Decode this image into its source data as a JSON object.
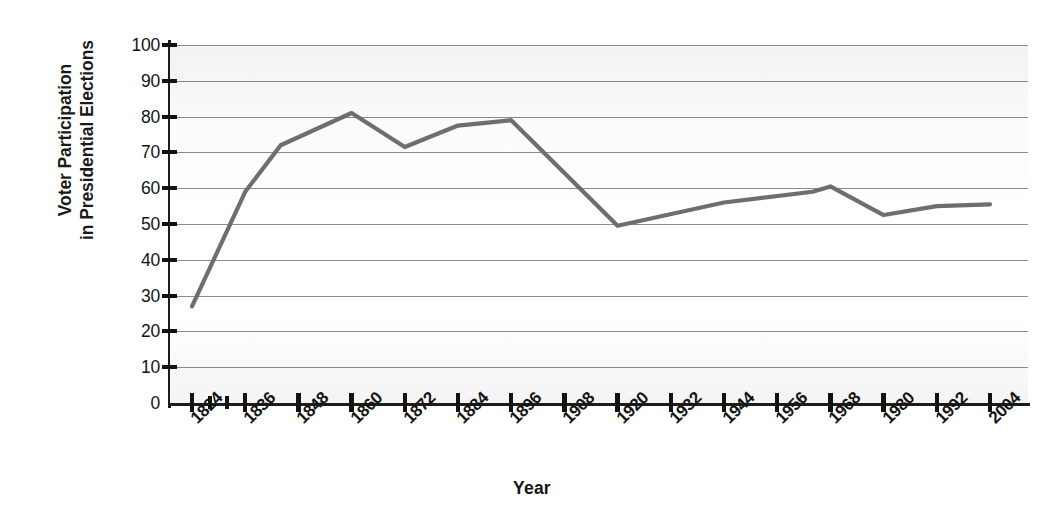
{
  "chart_data": {
    "type": "line",
    "title": "",
    "xlabel": "Year",
    "ylabel": "Voter Participation in Presidential Elections",
    "ylabel_line1": "Voter Participation",
    "ylabel_line2": "in Presidential Elections",
    "xlim": [
      1824,
      2004
    ],
    "ylim": [
      0,
      100
    ],
    "grid": true,
    "legend": "none",
    "line_color": "#6e6e6e",
    "x_tick_labels": [
      "1824",
      "1836",
      "1848",
      "1860",
      "1872",
      "1884",
      "1896",
      "1908",
      "1920",
      "1932",
      "1944",
      "1956",
      "1968",
      "1980",
      "1992",
      "2004"
    ],
    "y_tick_labels": [
      "0",
      "10",
      "20",
      "30",
      "40",
      "50",
      "60",
      "70",
      "80",
      "90",
      "100"
    ],
    "y_ticks": [
      0,
      10,
      20,
      30,
      40,
      50,
      60,
      70,
      80,
      90,
      100
    ],
    "x": [
      1824,
      1836,
      1844,
      1860,
      1872,
      1884,
      1896,
      1920,
      1944,
      1964,
      1968,
      1980,
      1992,
      2004
    ],
    "values": [
      27,
      59,
      72,
      81,
      71.5,
      77.5,
      79,
      49.5,
      56,
      59,
      60.5,
      52.5,
      55,
      55.5
    ],
    "points": [
      {
        "year": 1824,
        "value": 27
      },
      {
        "year": 1836,
        "value": 59
      },
      {
        "year": 1844,
        "value": 72
      },
      {
        "year": 1860,
        "value": 81
      },
      {
        "year": 1872,
        "value": 71.5
      },
      {
        "year": 1884,
        "value": 77.5
      },
      {
        "year": 1896,
        "value": 79
      },
      {
        "year": 1920,
        "value": 49.5
      },
      {
        "year": 1944,
        "value": 56
      },
      {
        "year": 1964,
        "value": 59
      },
      {
        "year": 1968,
        "value": 60.5
      },
      {
        "year": 1980,
        "value": 52.5
      },
      {
        "year": 1992,
        "value": 55
      },
      {
        "year": 2004,
        "value": 55.5
      }
    ]
  }
}
